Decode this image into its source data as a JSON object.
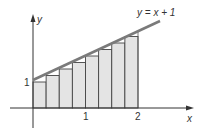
{
  "chart_data": {
    "type": "bar",
    "title": "",
    "annotation": "y = x + 1",
    "xlabel": "x",
    "ylabel": "y",
    "x_ticks": [
      "1",
      "2"
    ],
    "y_ticks": [
      "1"
    ],
    "function": "y = x + 1",
    "rectangles": {
      "count": 8,
      "width": 0.25,
      "x_left": [
        0,
        0.25,
        0.5,
        0.75,
        1.0,
        1.25,
        1.5,
        1.75
      ],
      "heights": [
        1.0,
        1.25,
        1.5,
        1.75,
        2.0,
        2.25,
        2.5,
        2.75
      ]
    },
    "xlim": [
      -0.45,
      3.0
    ],
    "ylim": [
      -0.75,
      3.6
    ],
    "grid": false
  },
  "labels": {
    "curve": "y = x + 1",
    "x_axis": "x",
    "y_axis": "y",
    "tick_x1": "1",
    "tick_x2": "2",
    "tick_y1": "1"
  },
  "colors": {
    "line": "#7a7a7a",
    "rect_fill": "#e4e4e4",
    "rect_stroke": "#444444",
    "axis": "#333333"
  }
}
